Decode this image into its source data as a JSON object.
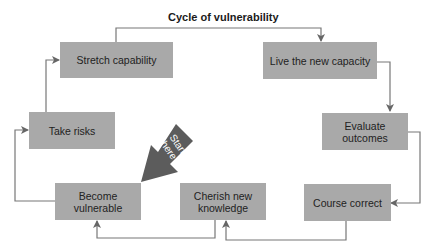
{
  "diagram": {
    "title": "Cycle of vulnerability",
    "start_label": "Start here",
    "start_label_lines": [
      "Start",
      "here"
    ],
    "colors": {
      "box_fill": "#a9a9a9",
      "line": "#666666",
      "start_arrow": "#5c5c5c",
      "text": "#222222"
    },
    "nodes": [
      {
        "id": "stretch",
        "label": "Stretch capability"
      },
      {
        "id": "live",
        "label": "Live the new capacity"
      },
      {
        "id": "evaluate",
        "label": "Evaluate outcomes",
        "lines": [
          "Evaluate",
          "outcomes"
        ]
      },
      {
        "id": "course",
        "label": "Course correct"
      },
      {
        "id": "cherish",
        "label": "Cherish new knowledge",
        "lines": [
          "Cherish new",
          "knowledge"
        ]
      },
      {
        "id": "become",
        "label": "Become vulnerable",
        "lines": [
          "Become",
          "vulnerable"
        ]
      },
      {
        "id": "risks",
        "label": "Take risks"
      }
    ],
    "edges": [
      {
        "from": "stretch",
        "to": "live"
      },
      {
        "from": "live",
        "to": "evaluate"
      },
      {
        "from": "evaluate",
        "to": "course"
      },
      {
        "from": "course",
        "to": "cherish"
      },
      {
        "from": "cherish",
        "to": "become"
      },
      {
        "from": "become",
        "to": "risks"
      },
      {
        "from": "risks",
        "to": "stretch"
      }
    ]
  }
}
